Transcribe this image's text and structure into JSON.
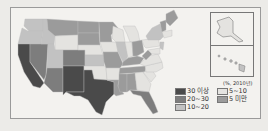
{
  "map": {
    "subject": "US states shaded by percentage",
    "unit_label": "(%, 2010년)",
    "legend": [
      {
        "label": "30 이상",
        "color": "#4a4a4a"
      },
      {
        "label": "5~10",
        "color": "#e4e3e0"
      },
      {
        "label": "20~30",
        "color": "#7d7d7d"
      },
      {
        "label": "5 미만",
        "color": "#9b9b9b"
      },
      {
        "label": "10~20",
        "color": "#c2c2c2"
      }
    ],
    "insets": [
      "Alaska",
      "Hawaii"
    ]
  }
}
